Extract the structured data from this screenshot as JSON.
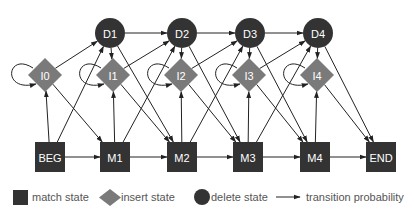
{
  "diagram": {
    "type": "profile-hmm-state-diagram",
    "colors": {
      "match": "#333333",
      "insert": "#7a7a7a",
      "delete": "#333333",
      "edge": "#222222",
      "node_text": "#ffffff",
      "legend_text": "#555555"
    },
    "nodes": {
      "match": [
        {
          "id": "BEG",
          "label": "BEG"
        },
        {
          "id": "M1",
          "label": "M1"
        },
        {
          "id": "M2",
          "label": "M2"
        },
        {
          "id": "M3",
          "label": "M3"
        },
        {
          "id": "M4",
          "label": "M4"
        },
        {
          "id": "END",
          "label": "END"
        }
      ],
      "insert": [
        {
          "id": "I0",
          "label": "I0"
        },
        {
          "id": "I1",
          "label": "I1"
        },
        {
          "id": "I2",
          "label": "I2"
        },
        {
          "id": "I3",
          "label": "I3"
        },
        {
          "id": "I4",
          "label": "I4"
        }
      ],
      "delete": [
        {
          "id": "D1",
          "label": "D1"
        },
        {
          "id": "D2",
          "label": "D2"
        },
        {
          "id": "D3",
          "label": "D3"
        },
        {
          "id": "D4",
          "label": "D4"
        }
      ]
    },
    "edges": [
      [
        "BEG",
        "M1"
      ],
      [
        "M1",
        "M2"
      ],
      [
        "M2",
        "M3"
      ],
      [
        "M3",
        "M4"
      ],
      [
        "M4",
        "END"
      ],
      [
        "BEG",
        "I0"
      ],
      [
        "M1",
        "I1"
      ],
      [
        "M2",
        "I2"
      ],
      [
        "M3",
        "I3"
      ],
      [
        "M4",
        "I4"
      ],
      [
        "BEG",
        "D1"
      ],
      [
        "M1",
        "D2"
      ],
      [
        "M2",
        "D3"
      ],
      [
        "M3",
        "D4"
      ],
      [
        "I0",
        "M1"
      ],
      [
        "I1",
        "M2"
      ],
      [
        "I2",
        "M3"
      ],
      [
        "I3",
        "M4"
      ],
      [
        "I4",
        "END"
      ],
      [
        "I0",
        "D1"
      ],
      [
        "I1",
        "D2"
      ],
      [
        "I2",
        "D3"
      ],
      [
        "I3",
        "D4"
      ],
      [
        "I0",
        "I0"
      ],
      [
        "I1",
        "I1"
      ],
      [
        "I2",
        "I2"
      ],
      [
        "I3",
        "I3"
      ],
      [
        "I4",
        "I4"
      ],
      [
        "D1",
        "D2"
      ],
      [
        "D2",
        "D3"
      ],
      [
        "D3",
        "D4"
      ],
      [
        "D1",
        "I1"
      ],
      [
        "D2",
        "I2"
      ],
      [
        "D3",
        "I3"
      ],
      [
        "D4",
        "I4"
      ],
      [
        "D1",
        "M2"
      ],
      [
        "D2",
        "M3"
      ],
      [
        "D3",
        "M4"
      ],
      [
        "D4",
        "END"
      ]
    ]
  },
  "legend": {
    "match_label": "match state",
    "insert_label": "insert state",
    "delete_label": "delete state",
    "transition_label": "transition probability"
  }
}
